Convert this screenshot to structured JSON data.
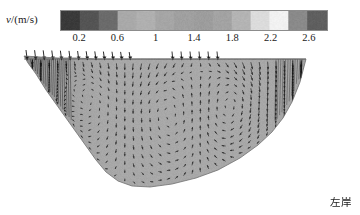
{
  "figure": {
    "type": "velocity-vector-cross-section",
    "bank_label": "左岸",
    "background_color": "#ffffff"
  },
  "colorbar": {
    "axis_label": "v/(m/s)",
    "label_symbol": "v",
    "label_unit": "/(m/s)",
    "orientation": "horizontal",
    "colormap": "grayscale-banded",
    "vmin": 0,
    "vmax": 2.8,
    "border_color": "#8c8c8c",
    "tick_values": [
      0.2,
      0.6,
      1,
      1.4,
      1.8,
      2.2,
      2.6
    ],
    "tick_labels": [
      "0.2",
      "0.6",
      "1",
      "1.4",
      "1.8",
      "2.2",
      "2.6"
    ],
    "bands": [
      {
        "value": 0.1,
        "color": "#3a3a3a"
      },
      {
        "value": 0.3,
        "color": "#545454"
      },
      {
        "value": 0.5,
        "color": "#6b6b6b"
      },
      {
        "value": 0.7,
        "color": "#a9a9a9"
      },
      {
        "value": 0.9,
        "color": "#b0b0b0"
      },
      {
        "value": 1.1,
        "color": "#a6a6a6"
      },
      {
        "value": 1.3,
        "color": "#a0a0a0"
      },
      {
        "value": 1.5,
        "color": "#9d9d9d"
      },
      {
        "value": 1.7,
        "color": "#a3a3a3"
      },
      {
        "value": 1.9,
        "color": "#b4b4b4"
      },
      {
        "value": 2.1,
        "color": "#dcdcdc"
      },
      {
        "value": 2.3,
        "color": "#f2f2f2"
      },
      {
        "value": 2.5,
        "color": "#8a8a8a"
      },
      {
        "value": 2.7,
        "color": "#5f5f5f"
      }
    ]
  },
  "chart_data": {
    "type": "quiver",
    "title": "",
    "xlabel": "",
    "ylabel": "",
    "colorbar_label": "v/(m/s)",
    "colorbar_ticks": [
      0.2,
      0.6,
      1,
      1.4,
      1.8,
      2.2,
      2.6
    ],
    "annotations": [
      "左岸"
    ],
    "grid": false,
    "legend": "none",
    "section_fill_color": "#a8a8a8",
    "section_outline_color": "#707070",
    "water_surface_y": 0,
    "cross_section_boundary": [
      [
        24,
        8
      ],
      [
        40,
        9
      ],
      [
        58,
        10
      ],
      [
        76,
        10
      ],
      [
        95,
        11
      ],
      [
        118,
        11
      ],
      [
        145,
        11
      ],
      [
        175,
        11
      ],
      [
        205,
        11
      ],
      [
        235,
        11
      ],
      [
        262,
        11
      ],
      [
        288,
        11
      ],
      [
        306,
        11
      ],
      [
        306,
        11
      ],
      [
        300,
        34
      ],
      [
        292,
        54
      ],
      [
        283,
        70
      ],
      [
        272,
        84
      ],
      [
        258,
        97
      ],
      [
        240,
        110
      ],
      [
        218,
        122
      ],
      [
        196,
        130
      ],
      [
        172,
        136
      ],
      [
        150,
        139
      ],
      [
        132,
        138
      ],
      [
        118,
        133
      ],
      [
        106,
        124
      ],
      [
        96,
        112
      ],
      [
        86,
        98
      ],
      [
        76,
        84
      ],
      [
        66,
        70
      ],
      [
        56,
        56
      ],
      [
        46,
        42
      ],
      [
        36,
        26
      ],
      [
        28,
        15
      ],
      [
        24,
        8
      ]
    ],
    "vector_columns": 34,
    "vectors_per_column": 14,
    "cells": [
      {
        "name": "left-bank-shear-zone",
        "x_range": [
          22,
          70
        ],
        "rotation": "downwelling",
        "speed": 0.3
      },
      {
        "name": "left-mid-vortex",
        "x_range": [
          70,
          130
        ],
        "rotation": "clockwise",
        "speed": 0.9
      },
      {
        "name": "central-vortex",
        "x_range": [
          130,
          200
        ],
        "rotation": "counter-clockwise",
        "speed": 1.6
      },
      {
        "name": "right-mid-vortex",
        "x_range": [
          200,
          260
        ],
        "rotation": "clockwise",
        "speed": 2.0
      },
      {
        "name": "right-bank-zone",
        "x_range": [
          260,
          310
        ],
        "rotation": "downwelling",
        "speed": 2.4
      }
    ]
  }
}
